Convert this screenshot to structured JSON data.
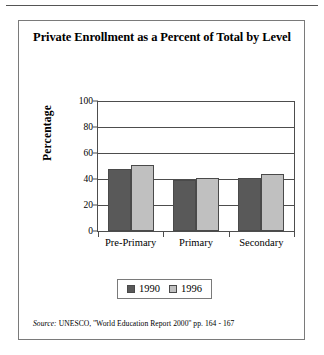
{
  "figure": {
    "title": "Private Enrollment as a Percent of Total by Level",
    "source_keyword": "Source:",
    "source_text": "UNESCO, ''World Education Report 2000'' pp. 164 - 167"
  },
  "chart_data": {
    "type": "bar",
    "title": "Private Enrollment as a Percent of Total by Level",
    "xlabel": "",
    "ylabel": "Percentage",
    "ylim": [
      0,
      100
    ],
    "yticks": [
      0,
      20,
      40,
      60,
      80,
      100
    ],
    "ytick_labels": [
      "0",
      "20",
      "40",
      "60",
      "80",
      "100"
    ],
    "grid": true,
    "legend_position": "bottom",
    "categories": [
      "Pre-Primary",
      "Primary",
      "Secondary"
    ],
    "series": [
      {
        "name": "1990",
        "color": "#595959",
        "values": [
          48,
          39,
          41
        ]
      },
      {
        "name": "1996",
        "color": "#c0c0c0",
        "values": [
          51,
          41,
          44
        ]
      }
    ]
  }
}
